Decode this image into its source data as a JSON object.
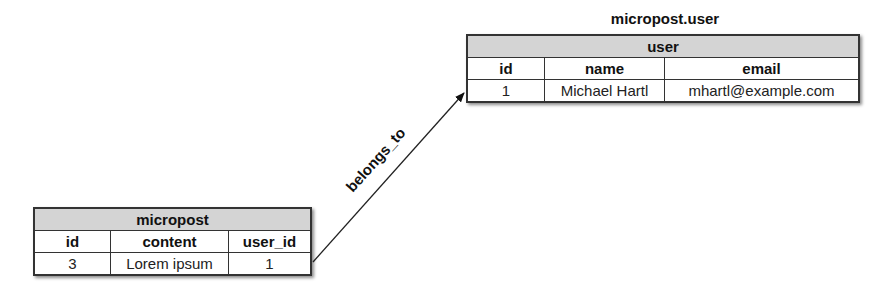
{
  "diagram": {
    "user_caption": "micropost.user",
    "user_table": {
      "title": "user",
      "columns": [
        "id",
        "name",
        "email"
      ],
      "rows": [
        [
          "1",
          "Michael Hartl",
          "mhartl@example.com"
        ]
      ]
    },
    "micropost_table": {
      "title": "micropost",
      "columns": [
        "id",
        "content",
        "user_id"
      ],
      "rows": [
        [
          "3",
          "Lorem ipsum",
          "1"
        ]
      ]
    },
    "relation": {
      "label": "belongs_to",
      "from": "micropost.user_id",
      "to": "user.id"
    }
  }
}
